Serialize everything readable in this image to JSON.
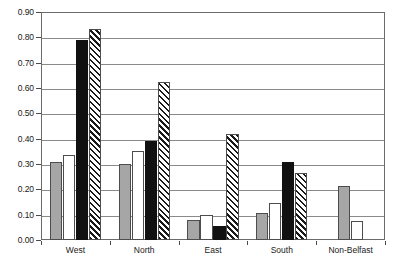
{
  "chart_data": {
    "type": "bar",
    "title": "",
    "subtitle": "",
    "xlabel": "",
    "ylabel": "",
    "categories": [
      "West",
      "North",
      "East",
      "South",
      "Non-Belfast"
    ],
    "ylim": [
      0.0,
      0.9
    ],
    "ytick_step": 0.1,
    "ytick_labels": [
      "0.00",
      "0.10",
      "0.20",
      "0.30",
      "0.40",
      "0.50",
      "0.60",
      "0.70",
      "0.80",
      "0.90"
    ],
    "ytick_values": [
      0.0,
      0.1,
      0.2,
      0.3,
      0.4,
      0.5,
      0.6,
      0.7,
      0.8,
      0.9
    ],
    "grid": true,
    "grid_axis": "y",
    "legend": null,
    "legend_position": "none",
    "series": [
      {
        "name": "series-1",
        "fill": "grey",
        "color": "#a6a6a6",
        "values": [
          0.31,
          0.3,
          0.078,
          0.105,
          0.215
        ]
      },
      {
        "name": "series-2",
        "fill": "white",
        "color": "#ffffff",
        "values": [
          0.335,
          0.35,
          0.097,
          0.145,
          0.077
        ]
      },
      {
        "name": "series-3",
        "fill": "black",
        "color": "#111111",
        "values": [
          0.79,
          0.39,
          0.057,
          0.31,
          null
        ]
      },
      {
        "name": "series-4",
        "fill": "diagonal-hatch",
        "color": "#1a1a1a",
        "values": [
          0.835,
          0.625,
          0.42,
          0.265,
          null
        ]
      }
    ]
  },
  "axes": {
    "frame_color": "#6b6b6b",
    "gridline_color": "#8a8a8a",
    "tick_color": "#4a4a4a",
    "text_color": "#1a1a1a"
  }
}
